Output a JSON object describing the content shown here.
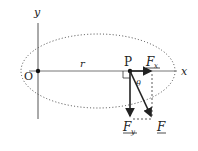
{
  "diagram": {
    "axes": {
      "x_label": "x",
      "y_label": "y",
      "origin_label": "O"
    },
    "point_label": "P",
    "radius_label": "r",
    "angle_label": "θ",
    "forces": {
      "fx_label": "F",
      "fx_sub": "x",
      "fy_label": "F",
      "fy_sub": "y",
      "f_label": "F"
    },
    "colors": {
      "line": "#222222",
      "axis": "#555555",
      "dotted": "#333333"
    }
  }
}
